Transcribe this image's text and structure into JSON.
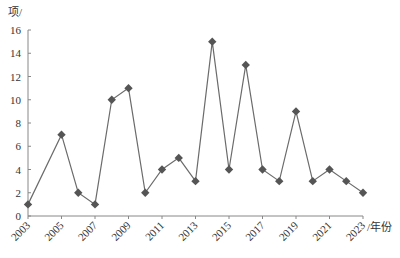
{
  "chart_data": {
    "type": "line",
    "title": "",
    "xlabel": "/年份",
    "ylabel": "项/",
    "x": [
      2003,
      2005,
      2006,
      2007,
      2008,
      2009,
      2010,
      2011,
      2012,
      2013,
      2014,
      2015,
      2016,
      2017,
      2018,
      2019,
      2020,
      2021,
      2022,
      2023
    ],
    "series": [
      {
        "name": "count",
        "values": [
          1,
          7,
          2,
          1,
          10,
          11,
          2,
          4,
          5,
          3,
          15,
          4,
          13,
          4,
          3,
          9,
          3,
          4,
          3,
          2
        ],
        "marker": "diamond",
        "color": "#555555"
      }
    ],
    "xlim": [
      2003,
      2023
    ],
    "ylim": [
      0,
      16
    ],
    "xticks": [
      2003,
      2005,
      2007,
      2009,
      2011,
      2013,
      2015,
      2017,
      2019,
      2021,
      2023
    ],
    "yticks": [
      0,
      2,
      4,
      6,
      8,
      10,
      12,
      14,
      16
    ],
    "xtick_rotation": -45,
    "grid": false,
    "legend": null
  },
  "colors": {
    "line": "#6b6b6b",
    "marker": "#555555",
    "axis": "#888888"
  }
}
